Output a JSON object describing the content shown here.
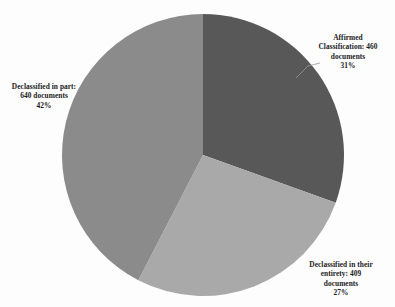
{
  "chart_data": {
    "type": "pie",
    "title": "",
    "subtitle": "",
    "xlabel": "",
    "ylabel": "",
    "legend_position": "none",
    "grid": false,
    "total_documents": 1509,
    "start_angle_deg": 0,
    "direction": "clockwise",
    "categories": [
      "Affirmed Classification",
      "Declassified in their entirety",
      "Declassified in part"
    ],
    "values": [
      460,
      409,
      640
    ],
    "percentages": [
      31,
      27,
      42
    ],
    "colors": [
      "#585858",
      "#a9a9a9",
      "#8b8b8b"
    ],
    "slices": [
      {
        "name": "Affirmed Classification",
        "value": 460,
        "percent": 31,
        "color": "#585858",
        "label_lines": [
          "Affirmed",
          "Classification: 460",
          "documents",
          "31%"
        ],
        "has_leader_line": true
      },
      {
        "name": "Declassified in their entirety",
        "value": 409,
        "percent": 27,
        "color": "#a9a9a9",
        "label_lines": [
          "Declassified in their",
          "entirety: 409",
          "documents",
          "27%"
        ],
        "has_leader_line": false
      },
      {
        "name": "Declassified in part",
        "value": 640,
        "percent": 42,
        "color": "#8b8b8b",
        "label_lines": [
          "Declassified in part:",
          "640 documents",
          "42%"
        ],
        "has_leader_line": false
      }
    ]
  },
  "labels": {
    "affirmed": {
      "line1": "Affirmed",
      "line2": "Classification: 460",
      "line3": "documents",
      "line4": "31%"
    },
    "entirety": {
      "line1": "Declassified in their",
      "line2": "entirety: 409",
      "line3": "documents",
      "line4": "27%"
    },
    "in_part": {
      "line1": "Declassified in part:",
      "line2": "640 documents",
      "line3": "42%"
    }
  },
  "style": {
    "background_color": "#fdfdfd",
    "text_color": "#1c1c1c",
    "leader_line_color": "#9a9a9a"
  }
}
